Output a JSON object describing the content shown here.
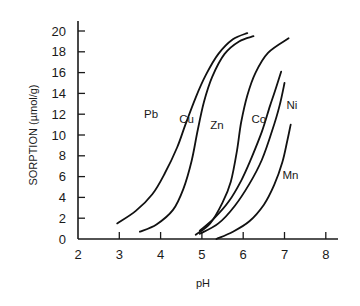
{
  "chart_data": {
    "type": "line",
    "title": "",
    "xlabel": "pH",
    "ylabel": "SORPTION (µmol/g)",
    "xlim": [
      2,
      8.4
    ],
    "ylim": [
      0,
      21.5
    ],
    "xticks": [
      2,
      3,
      4,
      5,
      6,
      7,
      8
    ],
    "yticks": [
      0,
      2,
      4,
      6,
      8,
      10,
      12,
      14,
      16,
      18,
      20
    ],
    "grid": false,
    "legend": "inline labels",
    "series": [
      {
        "name": "Pb",
        "label_pos": [
          3.6,
          11.6
        ],
        "points": [
          [
            2.95,
            1.5
          ],
          [
            3.4,
            2.7
          ],
          [
            3.8,
            4.3
          ],
          [
            4.1,
            6.3
          ],
          [
            4.4,
            8.8
          ],
          [
            4.6,
            11.0
          ],
          [
            4.85,
            13.6
          ],
          [
            5.1,
            15.8
          ],
          [
            5.4,
            17.8
          ],
          [
            5.75,
            19.2
          ],
          [
            6.1,
            19.8
          ]
        ]
      },
      {
        "name": "Cu",
        "label_pos": [
          4.45,
          11.2
        ],
        "points": [
          [
            3.5,
            0.7
          ],
          [
            3.9,
            1.4
          ],
          [
            4.3,
            2.8
          ],
          [
            4.55,
            4.8
          ],
          [
            4.75,
            7.5
          ],
          [
            4.9,
            10.5
          ],
          [
            5.05,
            13.2
          ],
          [
            5.25,
            15.6
          ],
          [
            5.55,
            17.8
          ],
          [
            5.9,
            19.0
          ],
          [
            6.25,
            19.5
          ]
        ]
      },
      {
        "name": "Zn",
        "label_pos": [
          5.2,
          10.6
        ],
        "points": [
          [
            4.85,
            0.4
          ],
          [
            5.2,
            1.5
          ],
          [
            5.5,
            3.5
          ],
          [
            5.7,
            5.5
          ],
          [
            5.85,
            8.5
          ],
          [
            5.95,
            11.2
          ],
          [
            6.1,
            13.8
          ],
          [
            6.3,
            16.0
          ],
          [
            6.6,
            17.9
          ],
          [
            7.1,
            19.3
          ]
        ]
      },
      {
        "name": "Co",
        "label_pos": [
          6.2,
          11.2
        ],
        "points": [
          [
            4.95,
            0.8
          ],
          [
            5.3,
            2.0
          ],
          [
            5.65,
            3.6
          ],
          [
            5.95,
            5.6
          ],
          [
            6.2,
            7.8
          ],
          [
            6.45,
            10.3
          ],
          [
            6.65,
            12.8
          ],
          [
            6.8,
            14.6
          ],
          [
            6.92,
            16.1
          ]
        ]
      },
      {
        "name": "Ni",
        "label_pos": [
          7.05,
          12.5
        ],
        "points": [
          [
            4.95,
            0.5
          ],
          [
            5.4,
            1.5
          ],
          [
            5.8,
            3.2
          ],
          [
            6.15,
            5.3
          ],
          [
            6.45,
            7.6
          ],
          [
            6.7,
            10.4
          ],
          [
            6.88,
            12.8
          ],
          [
            7.0,
            15.0
          ]
        ]
      },
      {
        "name": "Mn",
        "label_pos": [
          6.95,
          5.8
        ],
        "points": [
          [
            5.35,
            0.0
          ],
          [
            5.75,
            0.7
          ],
          [
            6.15,
            1.7
          ],
          [
            6.5,
            3.3
          ],
          [
            6.75,
            5.2
          ],
          [
            6.95,
            7.4
          ],
          [
            7.07,
            9.5
          ],
          [
            7.15,
            11.0
          ]
        ]
      }
    ]
  }
}
